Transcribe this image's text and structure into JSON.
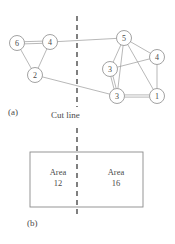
{
  "figure": {
    "panel_a": {
      "label": "(a)",
      "cut_line_label": "Cut line",
      "description": "graph with two partitions separated by a dashed cut line",
      "nodes": [
        {
          "id": "n6",
          "label": "6",
          "x": 17,
          "y": 43,
          "r": 7.5,
          "side": "left"
        },
        {
          "id": "n4l",
          "label": "4",
          "x": 50,
          "y": 42,
          "r": 7.5,
          "side": "left"
        },
        {
          "id": "n2",
          "label": "2",
          "x": 35,
          "y": 75,
          "r": 7.5,
          "side": "left"
        },
        {
          "id": "n5",
          "label": "5",
          "x": 124,
          "y": 38,
          "r": 7.5,
          "side": "right"
        },
        {
          "id": "n4r",
          "label": "4",
          "x": 157,
          "y": 57,
          "r": 7.5,
          "side": "right"
        },
        {
          "id": "n3u",
          "label": "3",
          "x": 110,
          "y": 69,
          "r": 7.5,
          "side": "right"
        },
        {
          "id": "n3b",
          "label": "3",
          "x": 117,
          "y": 96,
          "r": 7.5,
          "side": "right"
        },
        {
          "id": "n1",
          "label": "1",
          "x": 157,
          "y": 96,
          "r": 7.5,
          "side": "right"
        }
      ],
      "edges": [
        {
          "from": "n6",
          "to": "n4l",
          "multiplicity": 2
        },
        {
          "from": "n6",
          "to": "n2",
          "multiplicity": 1
        },
        {
          "from": "n4l",
          "to": "n2",
          "multiplicity": 1
        },
        {
          "from": "n5",
          "to": "n3u",
          "multiplicity": 1
        },
        {
          "from": "n5",
          "to": "n4r",
          "multiplicity": 1
        },
        {
          "from": "n5",
          "to": "n3b",
          "multiplicity": 1
        },
        {
          "from": "n5",
          "to": "n1",
          "multiplicity": 1
        },
        {
          "from": "n3u",
          "to": "n3b",
          "multiplicity": 2
        },
        {
          "from": "n3u",
          "to": "n4r",
          "multiplicity": 1
        },
        {
          "from": "n4r",
          "to": "n1",
          "multiplicity": 1
        },
        {
          "from": "n3b",
          "to": "n1",
          "multiplicity": 2
        }
      ],
      "cut_edges": [
        {
          "from": "n4l",
          "to": "n5"
        },
        {
          "from": "n2",
          "to": "n3b"
        }
      ],
      "cut_line": {
        "x": 77,
        "y_top": 16,
        "y_bottom": 107
      }
    },
    "panel_b": {
      "label": "(b)",
      "rect": {
        "x": 30,
        "y": 152,
        "width": 113,
        "height": 55
      },
      "cut_line": {
        "x": 77,
        "y_top": 128,
        "y_bottom": 215
      },
      "areas": [
        {
          "name": "Area",
          "value": "12"
        },
        {
          "name": "Area",
          "value": "16"
        }
      ]
    },
    "colors": {
      "stroke": "#8a8a8a",
      "edge": "#9a9a9a",
      "text": "#4a4a4a",
      "background": "#ffffff"
    }
  }
}
